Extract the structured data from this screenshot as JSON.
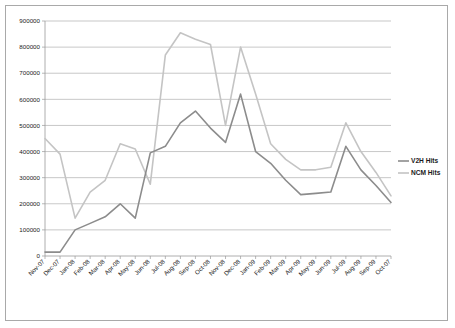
{
  "chart_data": {
    "type": "line",
    "title": "",
    "xlabel": "",
    "ylabel": "",
    "ylim": [
      0,
      900000
    ],
    "ytick_step": 100000,
    "yticks": [
      "0",
      "100000",
      "200000",
      "300000",
      "400000",
      "500000",
      "600000",
      "700000",
      "800000",
      "900000"
    ],
    "grid": true,
    "legend_position": "right",
    "categories": [
      "Nov-07",
      "Dec-07",
      "Jan-08",
      "Feb-08",
      "Mar-08",
      "Apr-08",
      "May-08",
      "Jun-08",
      "Jul-08",
      "Aug-08",
      "Sep-08",
      "Oct-08",
      "Nov-08",
      "Dec-08",
      "Jan-09",
      "Feb-09",
      "Mar-09",
      "Apr-09",
      "May-09",
      "Jun-09",
      "Jul-09",
      "Aug-09",
      "Sep-09",
      "Oct-07"
    ],
    "series": [
      {
        "name": "V2H Hits",
        "color": "#8c8c8c",
        "values": [
          15000,
          15000,
          100000,
          125000,
          150000,
          200000,
          145000,
          395000,
          420000,
          510000,
          555000,
          490000,
          435000,
          620000,
          400000,
          355000,
          290000,
          235000,
          240000,
          245000,
          420000,
          330000,
          270000,
          205000
        ]
      },
      {
        "name": "NCM Hits",
        "color": "#c4c4c4",
        "values": [
          450000,
          390000,
          145000,
          245000,
          290000,
          430000,
          410000,
          275000,
          770000,
          855000,
          830000,
          810000,
          500000,
          800000,
          620000,
          430000,
          370000,
          330000,
          330000,
          340000,
          510000,
          400000,
          320000,
          230000
        ]
      }
    ]
  },
  "legend": {
    "items": [
      {
        "label": "V2H Hits"
      },
      {
        "label": "NCM Hits"
      }
    ]
  }
}
